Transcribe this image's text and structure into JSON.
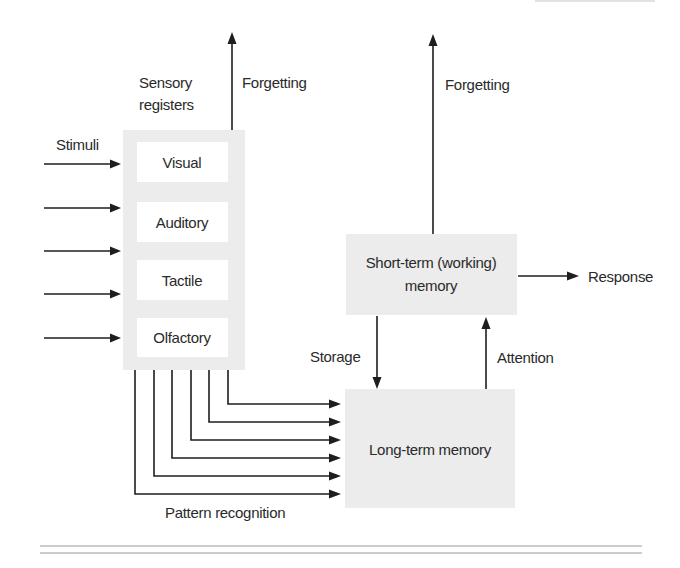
{
  "diagram": {
    "sensory": {
      "label_line1": "Sensory",
      "label_line2": "registers",
      "cells": [
        {
          "label": "Visual"
        },
        {
          "label": "Auditory"
        },
        {
          "label": "Tactile"
        },
        {
          "label": "Olfactory"
        }
      ]
    },
    "stimuli_label": "Stimuli",
    "forgetting_sensory_label": "Forgetting",
    "forgetting_stm_label": "Forgetting",
    "stm": {
      "label_line1": "Short-term (working)",
      "label_line2": "memory"
    },
    "ltm": {
      "label": "Long-term memory"
    },
    "response_label": "Response",
    "storage_label": "Storage",
    "attention_label": "Attention",
    "pattern_recognition_label": "Pattern recognition",
    "colors": {
      "box_fill": "#ececec",
      "cell_fill": "#ffffff",
      "line": "#1e1e1e",
      "text": "#2a2a2a"
    }
  }
}
